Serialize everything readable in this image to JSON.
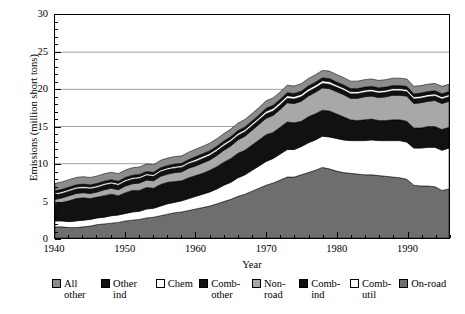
{
  "chart_data": {
    "type": "area",
    "stacked": true,
    "title": "",
    "xlabel": "Year",
    "ylabel": "Emissions (million short tons)",
    "xlim": [
      1940,
      1996
    ],
    "ylim": [
      0,
      30
    ],
    "ytick_major": [
      0,
      5,
      10,
      15,
      20,
      25,
      30
    ],
    "ytick_minor_step": 1,
    "xtick_major": [
      1940,
      1950,
      1960,
      1970,
      1980,
      1990
    ],
    "xtick_minor_step": 2,
    "grid": "horizontal-major",
    "legend_position": "below",
    "x": [
      1940,
      1941,
      1942,
      1943,
      1944,
      1945,
      1946,
      1947,
      1948,
      1949,
      1950,
      1951,
      1952,
      1953,
      1954,
      1955,
      1956,
      1957,
      1958,
      1959,
      1960,
      1961,
      1962,
      1963,
      1964,
      1965,
      1966,
      1967,
      1968,
      1969,
      1970,
      1971,
      1972,
      1973,
      1974,
      1975,
      1976,
      1977,
      1978,
      1979,
      1980,
      1981,
      1982,
      1983,
      1984,
      1985,
      1986,
      1987,
      1988,
      1989,
      1990,
      1991,
      1992,
      1993,
      1994,
      1995,
      1996
    ],
    "series": [
      {
        "name": "On-road",
        "color": "#6e6e6e",
        "values": [
          1.5,
          1.5,
          1.4,
          1.4,
          1.5,
          1.6,
          1.8,
          1.9,
          2.0,
          2.1,
          2.3,
          2.4,
          2.5,
          2.7,
          2.8,
          3.0,
          3.2,
          3.4,
          3.5,
          3.7,
          3.9,
          4.1,
          4.3,
          4.6,
          4.9,
          5.2,
          5.6,
          5.9,
          6.3,
          6.7,
          7.1,
          7.4,
          7.8,
          8.2,
          8.2,
          8.5,
          8.8,
          9.1,
          9.5,
          9.3,
          9.0,
          8.8,
          8.7,
          8.6,
          8.5,
          8.5,
          8.4,
          8.3,
          8.2,
          8.1,
          7.9,
          7.1,
          7.0,
          7.0,
          6.9,
          6.4,
          6.6
        ]
      },
      {
        "name": "Comb-util",
        "color": "#ffffff",
        "values": [
          0.8,
          0.8,
          0.8,
          0.9,
          0.9,
          0.9,
          0.9,
          0.9,
          1.0,
          1.0,
          1.0,
          1.1,
          1.1,
          1.2,
          1.2,
          1.3,
          1.4,
          1.4,
          1.5,
          1.6,
          1.7,
          1.8,
          1.9,
          2.0,
          2.2,
          2.3,
          2.5,
          2.6,
          2.8,
          3.0,
          3.2,
          3.3,
          3.5,
          3.7,
          3.7,
          3.8,
          4.0,
          4.1,
          4.2,
          4.3,
          4.4,
          4.4,
          4.4,
          4.5,
          4.6,
          4.7,
          4.7,
          4.8,
          4.9,
          5.0,
          5.0,
          5.0,
          5.1,
          5.2,
          5.3,
          5.4,
          5.5
        ]
      },
      {
        "name": "Comb-ind",
        "color": "#111111",
        "values": [
          2.3,
          2.5,
          2.8,
          3.0,
          3.0,
          2.8,
          2.8,
          2.9,
          2.9,
          2.6,
          2.8,
          2.9,
          2.8,
          2.9,
          2.7,
          2.9,
          2.9,
          2.8,
          2.7,
          2.8,
          2.8,
          2.8,
          2.9,
          3.0,
          3.1,
          3.2,
          3.3,
          3.3,
          3.4,
          3.5,
          3.6,
          3.5,
          3.6,
          3.7,
          3.6,
          3.4,
          3.5,
          3.5,
          3.5,
          3.5,
          3.3,
          3.1,
          2.8,
          2.7,
          2.8,
          2.8,
          2.7,
          2.7,
          2.8,
          2.8,
          2.8,
          2.7,
          2.7,
          2.8,
          2.8,
          2.8,
          2.8
        ]
      },
      {
        "name": "Non-road",
        "color": "#a8a8a8",
        "values": [
          0.6,
          0.6,
          0.7,
          0.7,
          0.7,
          0.7,
          0.7,
          0.8,
          0.8,
          0.8,
          0.9,
          0.9,
          1.0,
          1.0,
          1.0,
          1.1,
          1.1,
          1.2,
          1.2,
          1.3,
          1.3,
          1.4,
          1.4,
          1.5,
          1.6,
          1.7,
          1.8,
          1.9,
          2.0,
          2.1,
          2.2,
          2.3,
          2.4,
          2.6,
          2.6,
          2.7,
          2.8,
          2.9,
          3.0,
          3.0,
          3.0,
          3.0,
          2.9,
          3.0,
          3.1,
          3.1,
          3.1,
          3.2,
          3.3,
          3.3,
          3.4,
          3.3,
          3.4,
          3.4,
          3.5,
          3.5,
          3.5
        ]
      },
      {
        "name": "Comb-other",
        "color": "#111111",
        "values": [
          0.6,
          0.6,
          0.6,
          0.6,
          0.6,
          0.6,
          0.6,
          0.6,
          0.6,
          0.6,
          0.6,
          0.6,
          0.6,
          0.6,
          0.6,
          0.6,
          0.6,
          0.6,
          0.6,
          0.6,
          0.6,
          0.6,
          0.6,
          0.6,
          0.6,
          0.6,
          0.6,
          0.6,
          0.6,
          0.6,
          0.6,
          0.6,
          0.6,
          0.6,
          0.6,
          0.6,
          0.6,
          0.6,
          0.6,
          0.6,
          0.6,
          0.6,
          0.6,
          0.6,
          0.6,
          0.6,
          0.6,
          0.6,
          0.6,
          0.6,
          0.6,
          0.6,
          0.6,
          0.6,
          0.6,
          0.6,
          0.6
        ]
      },
      {
        "name": "Chem",
        "color": "#ffffff",
        "values": [
          0.25,
          0.25,
          0.25,
          0.25,
          0.25,
          0.25,
          0.25,
          0.25,
          0.25,
          0.25,
          0.25,
          0.25,
          0.25,
          0.25,
          0.25,
          0.25,
          0.25,
          0.25,
          0.25,
          0.25,
          0.3,
          0.3,
          0.3,
          0.3,
          0.3,
          0.3,
          0.3,
          0.3,
          0.3,
          0.3,
          0.35,
          0.35,
          0.35,
          0.35,
          0.35,
          0.35,
          0.35,
          0.35,
          0.35,
          0.35,
          0.3,
          0.3,
          0.3,
          0.3,
          0.3,
          0.3,
          0.3,
          0.3,
          0.3,
          0.3,
          0.3,
          0.3,
          0.3,
          0.3,
          0.3,
          0.3,
          0.3
        ]
      },
      {
        "name": "Other ind",
        "color": "#111111",
        "values": [
          0.3,
          0.3,
          0.3,
          0.3,
          0.3,
          0.3,
          0.3,
          0.3,
          0.3,
          0.3,
          0.3,
          0.3,
          0.3,
          0.3,
          0.3,
          0.3,
          0.3,
          0.3,
          0.3,
          0.3,
          0.35,
          0.35,
          0.35,
          0.35,
          0.35,
          0.35,
          0.35,
          0.35,
          0.35,
          0.35,
          0.4,
          0.4,
          0.4,
          0.4,
          0.4,
          0.4,
          0.4,
          0.4,
          0.4,
          0.4,
          0.4,
          0.4,
          0.4,
          0.4,
          0.4,
          0.4,
          0.4,
          0.4,
          0.4,
          0.4,
          0.4,
          0.4,
          0.4,
          0.4,
          0.4,
          0.4,
          0.4
        ]
      },
      {
        "name": "All other",
        "color": "#8c8c8c",
        "values": [
          1.0,
          1.0,
          1.0,
          1.0,
          1.0,
          1.0,
          1.0,
          1.0,
          1.0,
          1.0,
          1.0,
          1.0,
          1.0,
          1.0,
          1.0,
          1.0,
          1.0,
          1.0,
          1.0,
          1.0,
          1.0,
          1.0,
          1.0,
          1.0,
          1.0,
          1.0,
          1.0,
          1.0,
          1.0,
          1.0,
          1.0,
          1.0,
          1.0,
          1.0,
          1.0,
          1.0,
          1.0,
          1.0,
          1.0,
          1.0,
          1.0,
          1.0,
          1.0,
          1.0,
          1.0,
          1.0,
          1.0,
          1.0,
          1.0,
          1.0,
          1.0,
          1.0,
          1.0,
          1.0,
          1.0,
          1.0,
          1.0
        ]
      }
    ],
    "totals_note": {
      "start_1940": 7.35,
      "peak_1978": 25.55,
      "end_1996": 20.9
    }
  },
  "axes": {
    "y_ticks": [
      "0",
      "5",
      "10",
      "15",
      "20",
      "25",
      "30"
    ],
    "x_ticks": [
      "1940",
      "1950",
      "1960",
      "1970",
      "1980",
      "1990"
    ],
    "y_title": "Emissions (million short tons)",
    "x_title": "Year"
  },
  "legend": {
    "items": [
      {
        "label_line1": "All",
        "label_line2": "other",
        "color": "#8c8c8c",
        "swatch": "filled"
      },
      {
        "label_line1": "Other",
        "label_line2": "ind",
        "color": "#111111",
        "swatch": "filled"
      },
      {
        "label_line1": "Chem",
        "label_line2": "",
        "color": "#ffffff",
        "swatch": "outline"
      },
      {
        "label_line1": "Comb-",
        "label_line2": "other",
        "color": "#111111",
        "swatch": "filled"
      },
      {
        "label_line1": "Non-",
        "label_line2": "road",
        "color": "#a8a8a8",
        "swatch": "filled"
      },
      {
        "label_line1": "Comb-",
        "label_line2": "ind",
        "color": "#111111",
        "swatch": "filled"
      },
      {
        "label_line1": "Comb-",
        "label_line2": "util",
        "color": "#ffffff",
        "swatch": "outline"
      },
      {
        "label_line1": "On-road",
        "label_line2": "",
        "color": "#6e6e6e",
        "swatch": "filled"
      }
    ]
  }
}
